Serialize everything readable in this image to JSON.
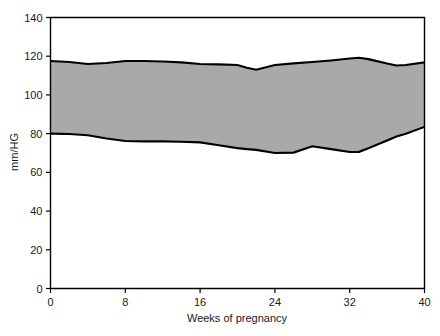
{
  "chart_data": {
    "type": "area",
    "title": "",
    "subtitle": "",
    "xlabel": "Weeks of pregnancy",
    "ylabel": "mm/HG",
    "xlim": [
      0,
      40
    ],
    "ylim": [
      0,
      140
    ],
    "xticks": [
      "0",
      "8",
      "16",
      "24",
      "32",
      "40"
    ],
    "xtick_values": [
      0,
      8,
      16,
      24,
      32,
      40
    ],
    "yticks": [
      "0",
      "20",
      "40",
      "60",
      "80",
      "100",
      "120",
      "140"
    ],
    "ytick_values": [
      0,
      20,
      40,
      60,
      80,
      100,
      120,
      140
    ],
    "grid": false,
    "legend_position": "none",
    "band_fill_color": "#a9a9a9",
    "band_edge_color": "#000000",
    "axis_color": "#000000",
    "background_color": "#ffffff",
    "x": [
      0,
      2,
      4,
      6,
      8,
      10,
      12,
      14,
      16,
      18,
      20,
      21,
      22,
      24,
      26,
      28,
      30,
      32,
      33,
      34,
      36,
      37,
      38,
      40
    ],
    "series": [
      {
        "name": "Upper limit (systolic)",
        "role": "band-upper",
        "values": [
          117.5,
          117.0,
          116.0,
          116.5,
          117.5,
          117.5,
          117.3,
          116.8,
          116.0,
          115.8,
          115.5,
          114.0,
          113.0,
          115.5,
          116.3,
          117.0,
          117.8,
          118.8,
          119.2,
          118.5,
          116.2,
          115.2,
          115.5,
          116.8
        ]
      },
      {
        "name": "Lower limit (diastolic)",
        "role": "band-lower",
        "values": [
          80.0,
          79.8,
          79.2,
          77.5,
          76.2,
          76.0,
          76.0,
          75.8,
          75.5,
          74.0,
          72.5,
          72.0,
          71.6,
          70.0,
          70.2,
          73.5,
          72.0,
          70.5,
          70.6,
          72.5,
          76.5,
          78.5,
          80.0,
          83.5
        ]
      }
    ]
  },
  "figure": {
    "y_axis_label": "mm/HG",
    "x_axis_label": "Weeks of pregnancy"
  }
}
